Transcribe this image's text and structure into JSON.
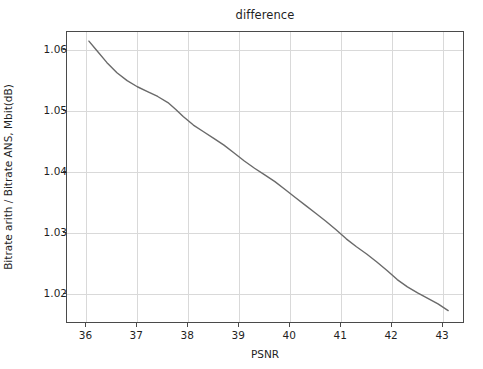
{
  "figure": {
    "background_color": "#ffffff",
    "axes_edge_color": "#4a4a4a",
    "grid_color": "#d9d9d9"
  },
  "chart_data": {
    "type": "line",
    "title": "difference",
    "xlabel": "PSNR",
    "ylabel": "Bitrate arith / Bitrate ANS, Mbit(dB)",
    "xlim": [
      35.62,
      43.43
    ],
    "ylim": [
      1.015,
      1.063
    ],
    "xticks": [
      36,
      37,
      38,
      39,
      40,
      41,
      42,
      43
    ],
    "xticklabels": [
      "36",
      "37",
      "38",
      "39",
      "40",
      "41",
      "42",
      "43"
    ],
    "yticks": [
      1.02,
      1.03,
      1.04,
      1.05,
      1.06
    ],
    "yticklabels": [
      "1.02",
      "1.03",
      "1.04",
      "1.05",
      "1.06"
    ],
    "grid": true,
    "legend": null,
    "series": [
      {
        "name": "difference",
        "color": "#6a6a6a",
        "linewidth": 1.4,
        "x": [
          36.05,
          36.2,
          36.4,
          36.6,
          36.8,
          37.0,
          37.2,
          37.4,
          37.6,
          37.75,
          37.9,
          38.1,
          38.3,
          38.5,
          38.7,
          38.9,
          39.1,
          39.3,
          39.5,
          39.7,
          39.9,
          40.1,
          40.3,
          40.5,
          40.7,
          40.9,
          41.1,
          41.3,
          41.5,
          41.7,
          41.9,
          42.1,
          42.3,
          42.5,
          42.7,
          42.9,
          43.1
        ],
        "y": [
          1.0615,
          1.06,
          1.058,
          1.0563,
          1.055,
          1.054,
          1.0532,
          1.0524,
          1.0514,
          1.0503,
          1.0491,
          1.0477,
          1.0466,
          1.0455,
          1.0444,
          1.0431,
          1.0418,
          1.0406,
          1.0395,
          1.0384,
          1.0371,
          1.0358,
          1.0345,
          1.0332,
          1.0319,
          1.0305,
          1.029,
          1.0277,
          1.0265,
          1.0252,
          1.0238,
          1.0223,
          1.0211,
          1.0201,
          1.0192,
          1.0183,
          1.0172
        ]
      }
    ]
  }
}
